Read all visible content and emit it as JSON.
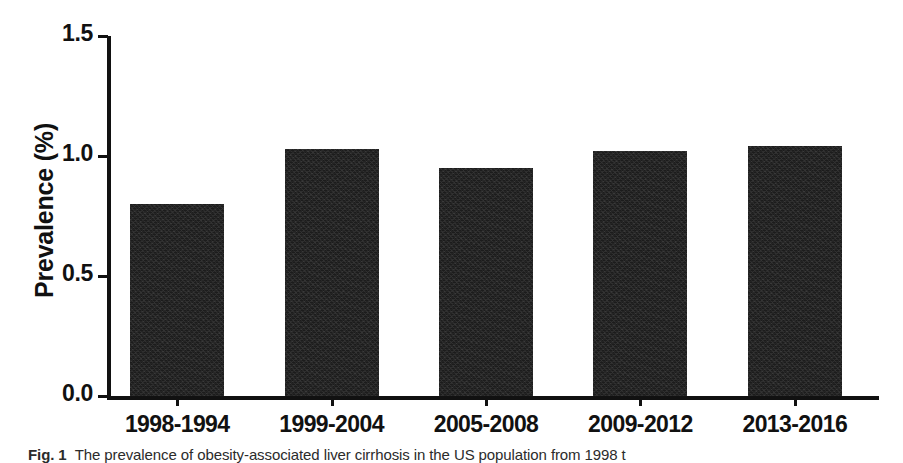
{
  "chart_data": {
    "type": "bar",
    "title": "",
    "subtitle": "",
    "xlabel": "",
    "ylabel": "Prevalence (%)",
    "categories": [
      "1998-1994",
      "1999-2004",
      "2005-2008",
      "2009-2012",
      "2013-2016"
    ],
    "values": [
      0.8,
      1.03,
      0.95,
      1.02,
      1.04
    ],
    "series": [
      {
        "name": "Prevalence",
        "values": [
          0.8,
          1.03,
          0.95,
          1.02,
          1.04
        ]
      }
    ],
    "ylim": [
      0.0,
      1.5
    ],
    "ytick_labels": [
      "0.0",
      "0.5",
      "1.0",
      "1.5"
    ],
    "ytick_values": [
      0.0,
      0.5,
      1.0,
      1.5
    ],
    "grid": false,
    "legend": false,
    "legend_position": "none",
    "bar_color": "#1c1c1c",
    "axis_color": "#111111",
    "background_color": "#ffffff"
  },
  "caption": {
    "figure_number": "Fig. 1",
    "text": "The prevalence of obesity-associated liver cirrhosis in the US population from 1998 t"
  }
}
